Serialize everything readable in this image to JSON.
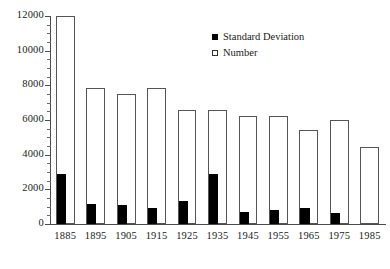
{
  "chart_data": {
    "type": "bar",
    "title": "",
    "xlabel": "",
    "ylabel": "",
    "ylim": [
      0,
      12000
    ],
    "ytick_step": 2000,
    "yminor_step": 500,
    "grid": false,
    "legend_position": "top-right",
    "categories": [
      "1885",
      "1895",
      "1905",
      "1915",
      "1925",
      "1935",
      "1945",
      "1955",
      "1965",
      "1975",
      "1985"
    ],
    "yticks": [
      "0",
      "2000",
      "4000",
      "6000",
      "8000",
      "10000",
      "12000"
    ],
    "series": [
      {
        "name": "Number",
        "style": "open",
        "color": "#ffffff",
        "edge_color": "#555555",
        "values": [
          12000,
          7850,
          7500,
          7850,
          6550,
          6550,
          6250,
          6250,
          5450,
          6000,
          4450
        ]
      },
      {
        "name": "Standard Deviation",
        "style": "filled",
        "color": "#000000",
        "values": [
          2900,
          1150,
          1100,
          950,
          1300,
          2900,
          700,
          800,
          900,
          650,
          0
        ]
      }
    ]
  },
  "legend": {
    "items": [
      {
        "label": "Standard Deviation",
        "marker": "filled-square-icon"
      },
      {
        "label": "Number",
        "marker": "open-square-icon"
      }
    ]
  }
}
